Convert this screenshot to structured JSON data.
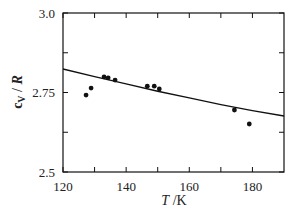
{
  "chart_data": {
    "type": "scatter",
    "title": "",
    "xlabel": "T /K",
    "ylabel": "cV / R",
    "xlim": [
      120,
      190
    ],
    "ylim": [
      2.5,
      3.0
    ],
    "x_ticks": [
      120,
      130,
      140,
      150,
      160,
      170,
      180
    ],
    "x_tick_labels": [
      "120",
      "140",
      "160",
      "180"
    ],
    "y_ticks": [
      2.5,
      2.625,
      2.75,
      2.875,
      3.0
    ],
    "y_tick_labels": [
      "2.5",
      "2.75",
      "3.0"
    ],
    "grid": false,
    "legend": null,
    "series": [
      {
        "name": "measured",
        "kind": "scatter",
        "marker": "filled-circle",
        "color": "#111111",
        "points": [
          {
            "x": 127.3,
            "y": 2.742
          },
          {
            "x": 128.9,
            "y": 2.764
          },
          {
            "x": 133.0,
            "y": 2.799
          },
          {
            "x": 134.3,
            "y": 2.796
          },
          {
            "x": 136.5,
            "y": 2.789
          },
          {
            "x": 146.7,
            "y": 2.77
          },
          {
            "x": 148.9,
            "y": 2.77
          },
          {
            "x": 150.5,
            "y": 2.761
          },
          {
            "x": 174.3,
            "y": 2.695
          },
          {
            "x": 179.0,
            "y": 2.651
          }
        ]
      },
      {
        "name": "model",
        "kind": "line",
        "color": "#111111",
        "points": [
          {
            "x": 120,
            "y": 2.824
          },
          {
            "x": 130,
            "y": 2.8
          },
          {
            "x": 140,
            "y": 2.777
          },
          {
            "x": 150,
            "y": 2.754
          },
          {
            "x": 160,
            "y": 2.733
          },
          {
            "x": 170,
            "y": 2.712
          },
          {
            "x": 180,
            "y": 2.693
          },
          {
            "x": 190,
            "y": 2.676
          }
        ]
      }
    ]
  }
}
